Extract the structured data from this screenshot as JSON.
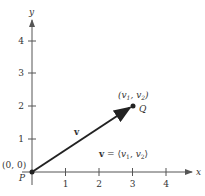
{
  "diagram": {
    "axes": {
      "x_label": "x",
      "y_label": "y",
      "x_ticks": [
        "1",
        "2",
        "3",
        "4"
      ],
      "y_ticks": [
        "1",
        "2",
        "3",
        "4"
      ]
    },
    "points": {
      "P": {
        "name": "P",
        "coord_label": "(0, 0)",
        "x": 0,
        "y": 0
      },
      "Q": {
        "name": "Q",
        "coord_label": "(v1, v2)",
        "x": 3,
        "y": 2
      }
    },
    "vector": {
      "name": "v",
      "component_form": "v = ⟨v1, v2⟩"
    },
    "colors": {
      "ink": "#222222",
      "axis": "#555555"
    }
  }
}
